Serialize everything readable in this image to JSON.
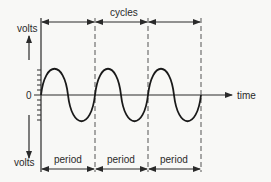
{
  "diagram": {
    "axes": {
      "y_top_label": "volts",
      "y_bottom_label": "volts",
      "origin_label": "0",
      "x_label": "time"
    },
    "top_dimension": {
      "label": "cycles",
      "count": 3
    },
    "bottom_dimensions": [
      {
        "label": "period"
      },
      {
        "label": "period"
      },
      {
        "label": "period"
      }
    ],
    "colors": {
      "ink": "#2a2a2a",
      "dashed": "#555555",
      "background": "#f8f8f6"
    }
  }
}
